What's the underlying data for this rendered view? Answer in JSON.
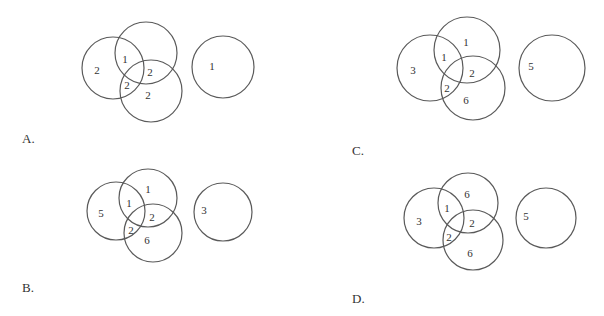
{
  "options": [
    {
      "label": "A.",
      "label_pos": [
        22,
        143
      ],
      "circles": [
        {
          "cx": 113,
          "cy": 68,
          "r": 31
        },
        {
          "cx": 146,
          "cy": 53,
          "r": 31
        },
        {
          "cx": 151,
          "cy": 91,
          "r": 31
        },
        {
          "cx": 223,
          "cy": 67,
          "r": 31
        }
      ],
      "numbers": [
        {
          "text": "2",
          "x": 97,
          "y": 70
        },
        {
          "text": "1",
          "x": 125,
          "y": 59
        },
        {
          "text": "2",
          "x": 150,
          "y": 72
        },
        {
          "text": "2",
          "x": 127,
          "y": 85
        },
        {
          "text": "2",
          "x": 148,
          "y": 95
        },
        {
          "text": "1",
          "x": 212,
          "y": 66
        }
      ]
    },
    {
      "label": "B.",
      "label_pos": [
        22,
        292
      ],
      "circles": [
        {
          "cx": 116,
          "cy": 211,
          "r": 29
        },
        {
          "cx": 148,
          "cy": 198,
          "r": 29
        },
        {
          "cx": 153,
          "cy": 233,
          "r": 29
        },
        {
          "cx": 223,
          "cy": 212,
          "r": 29
        }
      ],
      "numbers": [
        {
          "text": "5",
          "x": 101,
          "y": 213
        },
        {
          "text": "1",
          "x": 148,
          "y": 189
        },
        {
          "text": "1",
          "x": 129,
          "y": 203
        },
        {
          "text": "2",
          "x": 152,
          "y": 217
        },
        {
          "text": "2",
          "x": 131,
          "y": 230
        },
        {
          "text": "6",
          "x": 147,
          "y": 240
        },
        {
          "text": "3",
          "x": 204,
          "y": 210
        }
      ]
    },
    {
      "label": "C.",
      "label_pos": [
        352,
        155
      ],
      "circles": [
        {
          "cx": 430,
          "cy": 68,
          "r": 33
        },
        {
          "cx": 467,
          "cy": 50,
          "r": 33
        },
        {
          "cx": 473,
          "cy": 88,
          "r": 32
        },
        {
          "cx": 552,
          "cy": 68,
          "r": 33
        }
      ],
      "numbers": [
        {
          "text": "3",
          "x": 413,
          "y": 70
        },
        {
          "text": "1",
          "x": 466,
          "y": 42
        },
        {
          "text": "1",
          "x": 444,
          "y": 57
        },
        {
          "text": "2",
          "x": 472,
          "y": 73
        },
        {
          "text": "2",
          "x": 447,
          "y": 88
        },
        {
          "text": "6",
          "x": 466,
          "y": 100
        },
        {
          "text": "5",
          "x": 531,
          "y": 66
        }
      ]
    },
    {
      "label": "D.",
      "label_pos": [
        352,
        303
      ],
      "circles": [
        {
          "cx": 434,
          "cy": 218,
          "r": 30
        },
        {
          "cx": 468,
          "cy": 203,
          "r": 30
        },
        {
          "cx": 473,
          "cy": 240,
          "r": 30
        },
        {
          "cx": 546,
          "cy": 218,
          "r": 30
        }
      ],
      "numbers": [
        {
          "text": "3",
          "x": 419,
          "y": 221
        },
        {
          "text": "6",
          "x": 467,
          "y": 194
        },
        {
          "text": "1",
          "x": 447,
          "y": 208
        },
        {
          "text": "2",
          "x": 472,
          "y": 223
        },
        {
          "text": "2",
          "x": 449,
          "y": 237
        },
        {
          "text": "6",
          "x": 470,
          "y": 253
        },
        {
          "text": "5",
          "x": 526,
          "y": 216
        }
      ]
    }
  ]
}
